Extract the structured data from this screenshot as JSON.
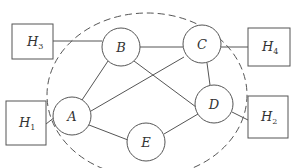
{
  "diagram": {
    "boundary": {
      "cx": 147,
      "cy": 95,
      "rx": 100,
      "ry": 82,
      "style": "dashed"
    },
    "nodes": [
      {
        "id": "A",
        "label": "A",
        "cx": 72,
        "cy": 116,
        "r": 19
      },
      {
        "id": "B",
        "label": "B",
        "cx": 121,
        "cy": 47,
        "r": 19
      },
      {
        "id": "C",
        "label": "C",
        "cx": 202,
        "cy": 44,
        "r": 19
      },
      {
        "id": "D",
        "label": "D",
        "cx": 214,
        "cy": 104,
        "r": 19
      },
      {
        "id": "E",
        "label": "E",
        "cx": 146,
        "cy": 142,
        "r": 19
      }
    ],
    "hosts": [
      {
        "id": "H1",
        "label": "H",
        "sub": "1",
        "x": 6,
        "y": 101,
        "w": 40,
        "h": 44
      },
      {
        "id": "H2",
        "label": "H",
        "sub": "2",
        "x": 248,
        "y": 96,
        "w": 40,
        "h": 42
      },
      {
        "id": "H3",
        "label": "H",
        "sub": "3",
        "x": 12,
        "y": 24,
        "w": 41,
        "h": 35
      },
      {
        "id": "H4",
        "label": "H",
        "sub": "4",
        "x": 248,
        "y": 28,
        "w": 42,
        "h": 38
      }
    ],
    "edges": [
      [
        "H3",
        "B"
      ],
      [
        "H4",
        "C"
      ],
      [
        "H1",
        "A"
      ],
      [
        "H2",
        "D"
      ],
      [
        "A",
        "B"
      ],
      [
        "A",
        "C"
      ],
      [
        "A",
        "E"
      ],
      [
        "B",
        "C"
      ],
      [
        "B",
        "D"
      ],
      [
        "C",
        "D"
      ],
      [
        "D",
        "E"
      ]
    ],
    "colors": {
      "stroke": "#555555",
      "text": "#333333",
      "background": "#ffffff"
    }
  }
}
